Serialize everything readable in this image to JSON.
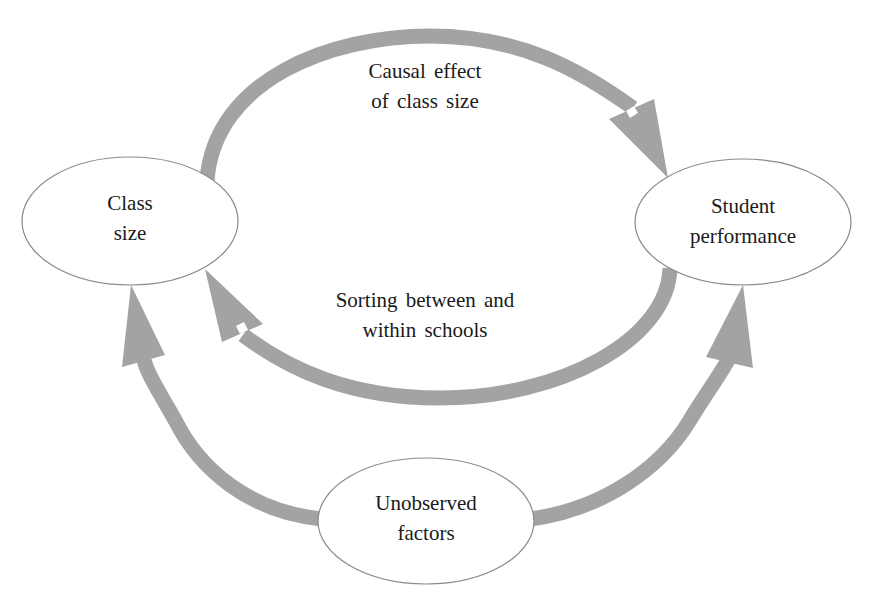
{
  "figure": {
    "caption_cutoff": "",
    "colors": {
      "arrow": "#a3a3a3",
      "node_border": "#8a8a8a",
      "node_fill": "#ffffff",
      "text": "#1a1a1a",
      "background": "#ffffff"
    }
  },
  "nodes": {
    "class_size": {
      "line1": "Class",
      "line2": "size"
    },
    "student_performance": {
      "line1": "Student",
      "line2": "performance"
    },
    "unobserved_factors": {
      "line1": "Unobserved",
      "line2": "factors"
    }
  },
  "edges": {
    "causal_effect": {
      "from": "Class size",
      "to": "Student performance",
      "line1": "Causal effect",
      "line2": "of class size"
    },
    "sorting": {
      "from": "Student performance",
      "to": "Class size",
      "line1": "Sorting between and",
      "line2": "within schools"
    },
    "unobserved_to_class": {
      "from": "Unobserved factors",
      "to": "Class size"
    },
    "unobserved_to_student": {
      "from": "Unobserved factors",
      "to": "Student performance"
    }
  }
}
